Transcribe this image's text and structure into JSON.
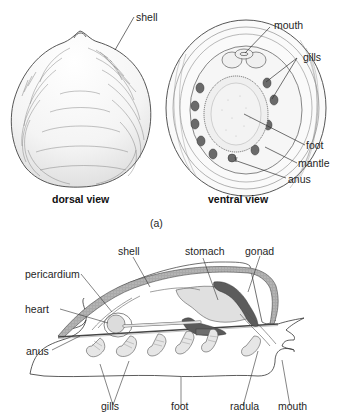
{
  "figure_a": {
    "dorsal": {
      "caption": "dorsal view",
      "labels": {
        "shell": "shell"
      }
    },
    "ventral": {
      "caption": "ventral view",
      "labels": {
        "mouth": "mouth",
        "gills": "gills",
        "foot": "foot",
        "mantle": "mantle",
        "anus": "anus"
      }
    },
    "panel_label": "(a)"
  },
  "figure_b": {
    "labels": {
      "shell": "shell",
      "stomach": "stomach",
      "gonad": "gonad",
      "pericardium": "pericardium",
      "heart": "heart",
      "anus": "anus",
      "gills": "gills",
      "foot": "foot",
      "radula": "radula",
      "mouth": "mouth"
    }
  },
  "colors": {
    "line": "#3a3a3a",
    "shell_fill": "#b8b8b8",
    "organ_light": "#e2e2e2",
    "organ_dark": "#5a5a5a"
  }
}
